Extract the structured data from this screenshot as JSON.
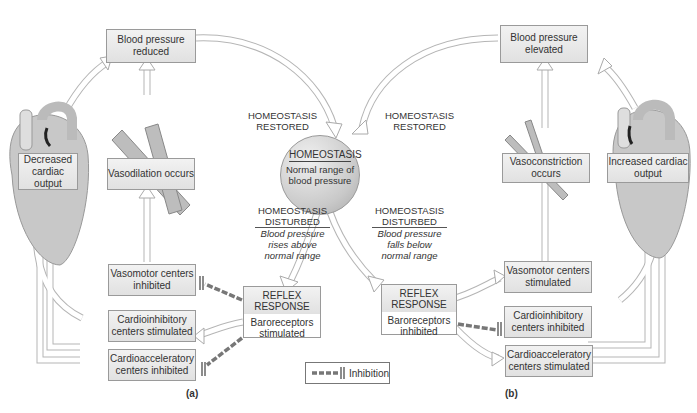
{
  "center": {
    "heading": "HOMEOSTASIS",
    "text": "Normal range of blood pressure"
  },
  "labels": {
    "restored_left": "HOMEOSTASIS RESTORED",
    "restored_right": "HOMEOSTASIS RESTORED",
    "disturbed_left": {
      "heading": "HOMEOSTASIS DISTURBED",
      "text": "Blood pressure rises above normal range"
    },
    "disturbed_right": {
      "heading": "HOMEOSTASIS DISTURBED",
      "text": "Blood pressure falls below normal range"
    }
  },
  "panel_a": {
    "label": "(a)",
    "bp": "Blood pressure reduced",
    "cardiac": "Decreased cardiac output",
    "vessel": "Vasodilation occurs",
    "vasomotor": "Vasomotor centers inhibited",
    "cardioinhibitory": "Cardioinhibitory centers stimulated",
    "cardioacceleratory": "Cardioacceleratory centers inhibited",
    "reflex": {
      "heading": "REFLEX RESPONSE",
      "text": "Baroreceptors stimulated"
    }
  },
  "panel_b": {
    "label": "(b)",
    "bp": "Blood pressure elevated",
    "cardiac": "Increased cardiac output",
    "vessel": "Vasoconstriction occurs",
    "vasomotor": "Vasomotor centers stimulated",
    "cardioinhibitory": "Cardioinhibitory centers inhibited",
    "cardioacceleratory": "Cardioacceleratory centers stimulated",
    "reflex": {
      "heading": "REFLEX RESPONSE",
      "text": "Baroreceptors inhibited"
    }
  },
  "legend": {
    "label": "Inhibition"
  },
  "colors": {
    "box_fill": "#e6e6e6",
    "arrow_stroke": "#aaaaaa",
    "inhibition": "#777777"
  }
}
